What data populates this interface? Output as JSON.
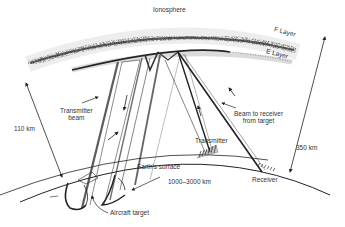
{
  "diagram": {
    "title": "Ionosphere",
    "labels": {
      "f_layer": "F Layer",
      "e_layer": "E Layer",
      "transmitter_beam_line1": "Transmitter",
      "transmitter_beam_line2": "beam",
      "beam_to_receiver_line1": "Beam to receiver",
      "beam_to_receiver_line2": "from target",
      "transmitter": "Transmitter",
      "earth_surface": "Earth's surface",
      "ground_range": "1000–3000 km",
      "receiver": "Receiver",
      "aircraft_target": "Aircraft target",
      "altitude_e": "110 km",
      "altitude_f": "350 km"
    },
    "colors": {
      "ink": "#222222",
      "layer_dark": "#333333",
      "background": "#ffffff"
    }
  }
}
